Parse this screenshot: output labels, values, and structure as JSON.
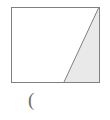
{
  "figure": {
    "background_color": "#ffffff",
    "stroke_color": "#808080",
    "stroke_width": 1,
    "shaded_fill_color": "#e9e9e9",
    "unshaded_fill_color": "#ffffff",
    "rectangle": {
      "name": "outer-rectangle",
      "x": 11,
      "y": 7,
      "width": 88,
      "height": 75,
      "corners": {
        "top_left": [
          11,
          7
        ],
        "top_right": [
          99,
          7
        ],
        "bottom_right": [
          99,
          82
        ],
        "bottom_left": [
          11,
          82
        ]
      }
    },
    "shaded_triangle": {
      "name": "shaded-right-triangle",
      "vertices": [
        [
          99,
          7
        ],
        [
          99,
          82
        ],
        [
          64,
          82
        ]
      ],
      "fill": "#e9e9e9",
      "description": "right triangle occupying the right portion of the rectangle, shaded light gray"
    },
    "diagonal_line": {
      "name": "diagonal-segment",
      "from": [
        99,
        7
      ],
      "to": [
        64,
        82
      ]
    },
    "unshaded_region": {
      "name": "unshaded-trapezoid",
      "vertices": [
        [
          11,
          7
        ],
        [
          99,
          7
        ],
        [
          64,
          82
        ],
        [
          11,
          82
        ]
      ],
      "fill": "#ffffff"
    }
  },
  "caption": {
    "text": "(",
    "color": "#6b6b6b"
  }
}
